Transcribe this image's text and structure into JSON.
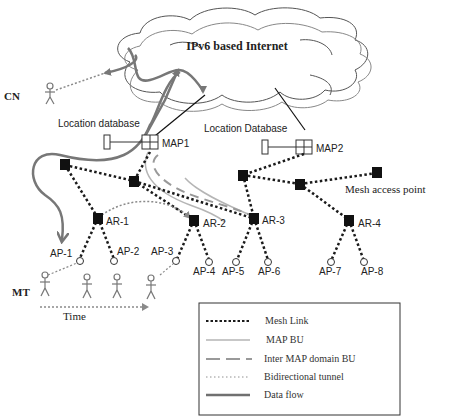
{
  "diagram": {
    "cloud_label": "IPv6 based Internet",
    "cn_label": "CN",
    "mt_label": "MT",
    "time_label": "Time",
    "location_db_1": "Location database",
    "location_db_2": "Location Database",
    "map1": "MAP1",
    "map2": "MAP2",
    "mesh_access_point": "Mesh access point",
    "ar": [
      "AR-1",
      "AR-2",
      "AR-3",
      "AR-4"
    ],
    "ap": [
      "AP-1",
      "AP-2",
      "AP-3",
      "AP-4",
      "AP-5",
      "AP-6",
      "AP-7",
      "AP-8"
    ]
  },
  "legend": {
    "items": [
      {
        "label": "Mesh Link",
        "style": "dotted-thick",
        "color": "#1a1a1a"
      },
      {
        "label": "MAP BU",
        "style": "solid-thin",
        "color": "#b0b0b0"
      },
      {
        "label": "Inter MAP domain BU",
        "style": "dashed",
        "color": "#909090"
      },
      {
        "label": "Bidirectional tunnel",
        "style": "dotted-thin",
        "color": "#909090"
      },
      {
        "label": "Data flow",
        "style": "solid-thick",
        "color": "#707070"
      }
    ]
  },
  "colors": {
    "node": "#111111",
    "mesh_link": "#1a1a1a",
    "data_flow": "#777777",
    "map_bu": "#b5b5b5",
    "inter_map_bu": "#999999",
    "tunnel": "#8a8a8a",
    "cloud_stroke": "#555555"
  }
}
